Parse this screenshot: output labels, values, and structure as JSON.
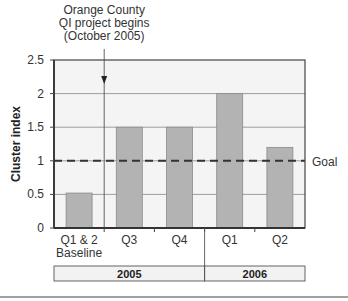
{
  "chart_data": {
    "type": "bar",
    "title": "",
    "xlabel": "",
    "ylabel": "Cluster index",
    "ylim": [
      0,
      2.5
    ],
    "yticks": [
      0,
      0.5,
      1,
      1.5,
      2,
      2.5
    ],
    "ytick_labels": [
      "0",
      "0.5",
      "1",
      "1.5",
      "2",
      "2.5"
    ],
    "grid": true,
    "categories": [
      "Q1 & 2 Baseline",
      "Q3",
      "Q4",
      "Q1",
      "Q2"
    ],
    "category_lines": [
      [
        "Q1 & 2",
        "Baseline"
      ],
      [
        "Q3"
      ],
      [
        "Q4"
      ],
      [
        "Q1"
      ],
      [
        "Q2"
      ]
    ],
    "values": [
      0.52,
      1.5,
      1.5,
      2.0,
      1.2
    ],
    "groups": [
      {
        "label": "2005",
        "categories": [
          "Q1 & 2 Baseline",
          "Q3",
          "Q4"
        ]
      },
      {
        "label": "2006",
        "categories": [
          "Q1",
          "Q2"
        ]
      }
    ],
    "reference_line": {
      "value": 1.0,
      "label": "Goal",
      "style": "dashed"
    },
    "annotation": {
      "lines": [
        "Orange County",
        "QI project begins",
        "(October 2005)"
      ],
      "position": "between Q1 & 2 Baseline and Q3",
      "arrow": "down"
    },
    "colors": {
      "bar": "#b3b3b3",
      "bar_edge": "#8a8a8a",
      "plot_bg": "#f4f4f4",
      "grid": "#888888",
      "axis": "#444444",
      "goal_line": "#333333"
    },
    "legend": null
  }
}
